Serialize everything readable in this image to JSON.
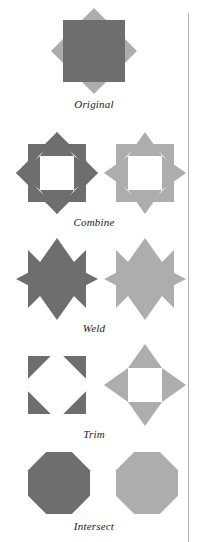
{
  "figure": {
    "type": "shape-boolean-operations-diagram",
    "background_color": "#ffffff",
    "divider_color": "#b2b2b2",
    "colors": {
      "dark_gray": "#6e6e6e",
      "light_gray": "#adadad",
      "hole_white": "#ffffff",
      "label_text": "#1a1a1a"
    },
    "rows": [
      {
        "id": "original",
        "label": "Original",
        "description": "A dark gray square overlapping a light gray diamond",
        "shapes": [
          {
            "name": "square-and-diamond-overlap",
            "kind": "square-over-diamond",
            "color": "#6e6e6e",
            "secondary_color": "#adadad"
          }
        ]
      },
      {
        "id": "combine",
        "label": "Combine",
        "description": "Eight-pointed star outlines with hollow octagonal centers",
        "shapes": [
          {
            "name": "combine-result-dark",
            "kind": "star8-hollow",
            "color": "#6e6e6e"
          },
          {
            "name": "combine-result-light",
            "kind": "star8-hollow",
            "color": "#adadad"
          }
        ]
      },
      {
        "id": "weld",
        "label": "Weld",
        "description": "Solid filled eight-pointed stars",
        "shapes": [
          {
            "name": "weld-result-dark",
            "kind": "star8-solid",
            "color": "#6e6e6e"
          },
          {
            "name": "weld-result-light",
            "kind": "star8-solid",
            "color": "#adadad"
          }
        ]
      },
      {
        "id": "trim",
        "label": "Trim",
        "description": "Left: four corner triangles remaining. Right: four point triangles remaining",
        "shapes": [
          {
            "name": "trim-result-corners",
            "kind": "corner-triangles",
            "color": "#6e6e6e"
          },
          {
            "name": "trim-result-points",
            "kind": "point-triangles",
            "color": "#adadad"
          }
        ]
      },
      {
        "id": "intersect",
        "label": "Intersect",
        "description": "Solid octagons formed by the overlap region",
        "shapes": [
          {
            "name": "intersect-result-dark",
            "kind": "octagon-solid",
            "color": "#6e6e6e"
          },
          {
            "name": "intersect-result-light",
            "kind": "octagon-solid",
            "color": "#adadad"
          }
        ]
      }
    ]
  }
}
